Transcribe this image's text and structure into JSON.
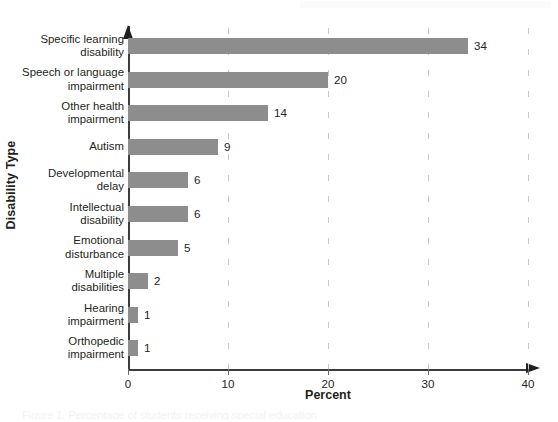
{
  "figure": {
    "y_axis_title": "Disability Type",
    "x_axis_title": "Percent",
    "caption_remnant": "Figure 1. Percentage of students receiving special education"
  },
  "chart_data": {
    "type": "bar",
    "orientation": "horizontal",
    "title": "",
    "xlabel": "Percent",
    "ylabel": "Disability Type",
    "xlim": [
      0,
      40
    ],
    "xticks": [
      0,
      10,
      20,
      30,
      40
    ],
    "xtick_labels": [
      "0",
      "10",
      "20",
      "30",
      "40"
    ],
    "grid": "vertical-dashed",
    "legend": "none",
    "bar_color": "#8d8d8d",
    "categories": [
      "Specific learning disability",
      "Speech or language impairment",
      "Other health impairment",
      "Autism",
      "Developmental delay",
      "Intellectual disability",
      "Emotional disturbance",
      "Multiple disabilities",
      "Hearing impairment",
      "Orthopedic impairment"
    ],
    "category_lines": [
      [
        "Specific learning",
        "disability"
      ],
      [
        "Speech or language",
        "impairment"
      ],
      [
        "Other health",
        "impairment"
      ],
      [
        "Autism"
      ],
      [
        "Developmental",
        "delay"
      ],
      [
        "Intellectual",
        "disability"
      ],
      [
        "Emotional",
        "disturbance"
      ],
      [
        "Multiple",
        "disabilities"
      ],
      [
        "Hearing",
        "impairment"
      ],
      [
        "Orthopedic",
        "impairment"
      ]
    ],
    "values": [
      34,
      20,
      14,
      9,
      6,
      6,
      5,
      2,
      1,
      1
    ],
    "value_labels": [
      "34",
      "20",
      "14",
      "9",
      "6",
      "6",
      "5",
      "2",
      "1",
      "1"
    ]
  }
}
